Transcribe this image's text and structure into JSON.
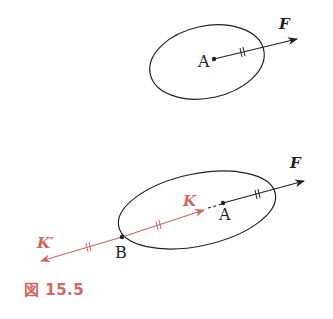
{
  "figure": {
    "caption": "図 15.5",
    "colors": {
      "black": "#222222",
      "red": "#d0685e",
      "background": "#ffffff"
    },
    "top_panel": {
      "point_label": "A",
      "force_label": "F"
    },
    "bottom_panel": {
      "point_a_label": "A",
      "point_b_label": "B",
      "force_label": "F",
      "k_label": "K",
      "k_prime_label": "K′"
    }
  }
}
